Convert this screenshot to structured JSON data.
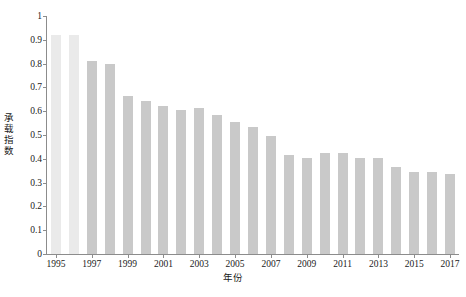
{
  "chart_data": {
    "type": "bar",
    "title": "",
    "xlabel": "年份",
    "ylabel": "承载指数",
    "categories": [
      "1995",
      "1996",
      "1997",
      "1998",
      "1999",
      "2000",
      "2001",
      "2002",
      "2003",
      "2004",
      "2005",
      "2006",
      "2007",
      "2008",
      "2009",
      "2010",
      "2011",
      "2012",
      "2013",
      "2014",
      "2015",
      "2016",
      "2017"
    ],
    "values": [
      0.92,
      0.92,
      0.81,
      0.8,
      0.665,
      0.645,
      0.62,
      0.605,
      0.615,
      0.585,
      0.555,
      0.535,
      0.495,
      0.415,
      0.405,
      0.425,
      0.425,
      0.405,
      0.405,
      0.365,
      0.345,
      0.345,
      0.335
    ],
    "ylim": [
      0,
      1
    ],
    "yticks": [
      "0",
      "0.1",
      "0.2",
      "0.3",
      "0.4",
      "0.5",
      "0.6",
      "0.7",
      "0.8",
      "0.9",
      "1"
    ],
    "ytick_values": [
      0,
      0.1,
      0.2,
      0.3,
      0.4,
      0.5,
      0.6,
      0.7,
      0.8,
      0.9,
      1
    ],
    "xticks": [
      "1995",
      "1997",
      "1999",
      "2001",
      "2003",
      "2005",
      "2007",
      "2009",
      "2011",
      "2013",
      "2015",
      "2017"
    ],
    "grid": false,
    "legend": "none",
    "bar_color": "#c9c9c9",
    "axis_color": "#8c8c8c",
    "background": "#ffffff"
  }
}
